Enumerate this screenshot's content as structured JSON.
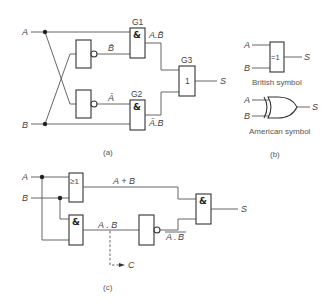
{
  "figure": {
    "a": {
      "caption": "(a)",
      "inputs": {
        "a": "A",
        "b": "B"
      },
      "gates": {
        "g1": {
          "name": "G1",
          "symbol": "&"
        },
        "g2": {
          "name": "G2",
          "symbol": "&"
        },
        "g3": {
          "name": "G3",
          "symbol": "1"
        }
      },
      "signals": {
        "not_b": "B̄",
        "not_a": "Ā",
        "g1_out": "A.B̄",
        "g2_out": "Ā.B",
        "output": "S"
      }
    },
    "b": {
      "caption": "(b)",
      "british": {
        "symbol": "=1",
        "input_a": "A",
        "input_b": "B",
        "output": "S",
        "label": "British symbol"
      },
      "american": {
        "input_a": "A",
        "input_b": "B",
        "output": "S",
        "label": "American symbol"
      }
    },
    "c": {
      "caption": "(c)",
      "inputs": {
        "a": "A",
        "b": "B"
      },
      "gates": {
        "or": {
          "symbol": "≥1"
        },
        "and1": {
          "symbol": "&"
        },
        "and_out": {
          "symbol": "&"
        }
      },
      "signals": {
        "or_out": "A + B",
        "and_out": "A . B",
        "nand_out_a": "A",
        "nand_out_dot": ".",
        "nand_out_b": "B",
        "carry": "C",
        "output": "S"
      }
    }
  }
}
